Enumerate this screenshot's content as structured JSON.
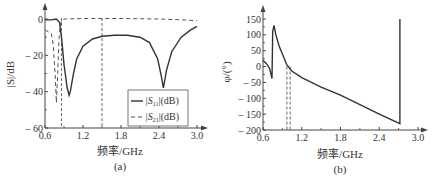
{
  "chart_data": [
    {
      "type": "line",
      "panel": "(a)",
      "xlabel": "频率/GHz",
      "ylabel": "|S|/dB",
      "xlim": [
        0.6,
        3.0
      ],
      "ylim": [
        -60,
        0
      ],
      "xticks": [
        "0.6",
        "1.2",
        "1.8",
        "2.4",
        "3.0"
      ],
      "yticks": [
        "0",
        "-20",
        "-40",
        "-60"
      ],
      "grid": false,
      "legend_position": "lower right",
      "vlines": [
        0.86,
        1.5
      ],
      "series": [
        {
          "name": "|S11|(dB)",
          "style": "solid",
          "x": [
            0.6,
            0.7,
            0.78,
            0.83,
            0.86,
            0.9,
            0.95,
            0.98,
            1.0,
            1.05,
            1.1,
            1.2,
            1.35,
            1.5,
            1.7,
            1.9,
            2.1,
            2.25,
            2.38,
            2.44,
            2.47,
            2.52,
            2.6,
            2.75,
            2.9,
            3.0
          ],
          "values": [
            -0.5,
            -0.5,
            0,
            -2,
            -10,
            -25,
            -38,
            -42,
            -40,
            -30,
            -22,
            -15,
            -11,
            -9.5,
            -9,
            -9,
            -10,
            -13,
            -22,
            -32,
            -38,
            -28,
            -18,
            -10,
            -6,
            -4
          ]
        },
        {
          "name": "|S21|(dB)",
          "style": "dashed",
          "x": [
            0.6,
            0.7,
            0.73,
            0.76,
            0.78,
            0.8,
            0.82,
            0.84,
            0.86,
            0.9,
            1.2,
            1.8,
            2.4,
            2.8,
            3.0
          ],
          "values": [
            -6,
            -8,
            -14,
            -30,
            -46,
            -30,
            -12,
            -4,
            -1,
            0,
            0.3,
            0.3,
            0,
            -0.5,
            -1
          ]
        }
      ],
      "legend": [
        "|S11|(dB)",
        "|S21|(dB)"
      ]
    },
    {
      "type": "line",
      "panel": "(b)",
      "xlabel": "频率/GHz",
      "ylabel": "φ/(°)",
      "xlim": [
        0.6,
        3.0
      ],
      "ylim": [
        -200,
        150
      ],
      "xticks": [
        "0.6",
        "1.2",
        "1.8",
        "2.4",
        "3.0"
      ],
      "yticks": [
        "150",
        "100",
        "50",
        "0",
        "-50",
        "-100",
        "-150",
        "-200"
      ],
      "grid": false,
      "vlines": [
        0.97,
        1.02
      ],
      "series": [
        {
          "name": "phase",
          "style": "solid",
          "x": [
            0.6,
            0.65,
            0.7,
            0.74,
            0.75,
            0.77,
            0.8,
            0.85,
            0.9,
            0.97,
            1.05,
            1.2,
            1.5,
            1.8,
            2.1,
            2.4,
            2.72,
            2.72
          ],
          "values": [
            20,
            10,
            -5,
            -38,
            110,
            130,
            100,
            65,
            40,
            5,
            -15,
            -35,
            -65,
            -90,
            -120,
            -150,
            -180,
            150
          ]
        }
      ]
    }
  ],
  "panel_a": {
    "ylabel": "|S|/dB",
    "xlabel": "频率/GHz",
    "caption": "(a)",
    "yticks": [
      "0",
      "– 20",
      "– 40",
      "– 60"
    ],
    "xticks": [
      "0.6",
      "1.2",
      "1.8",
      "2.4",
      "3.0"
    ],
    "legend_s11_prefix": "|S",
    "legend_s11_sub": "11",
    "legend_s11_suffix": "|(dB)",
    "legend_s21_prefix": "|S",
    "legend_s21_sub": "21",
    "legend_s21_suffix": "|(dB)"
  },
  "panel_b": {
    "ylabel": "φ/(°)",
    "xlabel": "频率/GHz",
    "caption": "(b)",
    "yticks": [
      "150",
      "100",
      "50",
      "0",
      "– 50",
      "– 100",
      "– 150",
      "– 200"
    ],
    "xticks": [
      "0.6",
      "1.2",
      "1.8",
      "2.4",
      "3.0"
    ]
  }
}
